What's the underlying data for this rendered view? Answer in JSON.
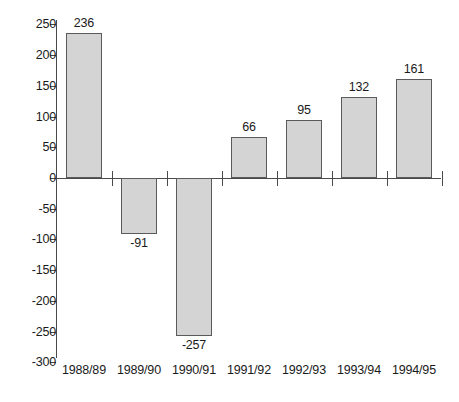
{
  "chart_data": {
    "type": "bar",
    "title": "",
    "subtitle": "",
    "xlabel": "",
    "ylabel": "",
    "categories": [
      "1988/89",
      "1989/90",
      "1990/91",
      "1991/92",
      "1992/93",
      "1993/94",
      "1994/95"
    ],
    "values": [
      236,
      -91,
      -257,
      66,
      95,
      132,
      161
    ],
    "data_labels": [
      "236",
      "-91",
      "-257",
      "66",
      "95",
      "132",
      "161"
    ],
    "ylim": [
      -300,
      250
    ],
    "ytick_step": 50,
    "ytick_labels": [
      "250",
      "200",
      "150",
      "100",
      "50",
      "0",
      "-50",
      "-100",
      "-150",
      "-200",
      "-250",
      "-300"
    ],
    "ytick_values": [
      250,
      200,
      150,
      100,
      50,
      0,
      -50,
      -100,
      -150,
      -200,
      -250,
      -300
    ],
    "grid": false,
    "legend": null,
    "legend_position": "none",
    "bar_fill_color": "#d4d4d4",
    "bar_border_color": "#5a5a5a",
    "axis_color": "#4a4a4a",
    "background_color": "#ffffff"
  }
}
